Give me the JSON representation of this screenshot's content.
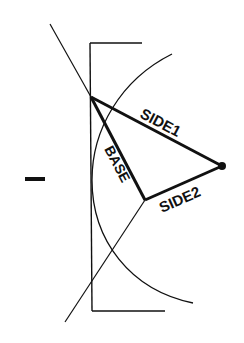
{
  "figure": {
    "labels": {
      "side1": "SIDE1",
      "side2": "SIDE2",
      "base": "BASE",
      "sign": "−"
    },
    "colors": {
      "ink": "#111111",
      "background": "#ffffff"
    },
    "points": {
      "apex": [
        91,
        97
      ],
      "vertex_b": [
        145,
        200
      ],
      "tip_dot": [
        222,
        166
      ]
    }
  }
}
